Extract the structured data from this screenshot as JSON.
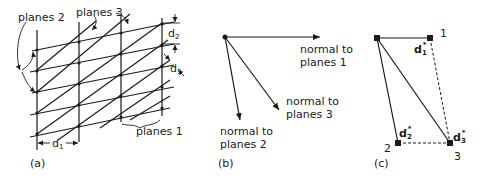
{
  "panels": {
    "a": {
      "caption": "(a)",
      "labels": {
        "planes1": "planes 1",
        "planes2": "planes 2",
        "planes3": "planes 3",
        "d1": "d",
        "d1_sub": "1",
        "d2": "d",
        "d2_sub": "2",
        "d3": "d",
        "d3_sub": "3"
      }
    },
    "b": {
      "caption": "(b)",
      "labels": {
        "n1_line1": "normal to",
        "n1_line2": "planes 1",
        "n2_line1": "normal to",
        "n2_line2": "planes 2",
        "n3_line1": "normal to",
        "n3_line2": "planes 3"
      }
    },
    "c": {
      "caption": "(c)",
      "labels": {
        "p1": "1",
        "p2": "2",
        "p3": "3",
        "d1": "d",
        "d1_sub": "1",
        "d2": "d",
        "d2_sub": "2",
        "d3": "d",
        "d3_sub": "3",
        "star": "*"
      }
    }
  },
  "colors": {
    "ink": "#1a1a1a",
    "background": "#ffffff"
  }
}
